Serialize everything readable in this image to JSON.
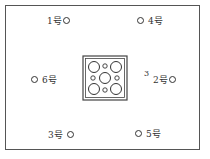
{
  "diagram": {
    "title": "",
    "stations": [
      {
        "id": "1",
        "label": "1号",
        "marker_side": "right"
      },
      {
        "id": "4",
        "label": "4号",
        "marker_side": "left"
      },
      {
        "id": "6",
        "label": "6号",
        "marker_side": "left"
      },
      {
        "id": "2",
        "label": "2号",
        "marker_side": "right"
      },
      {
        "id": "3",
        "label": "3号",
        "marker_side": "right"
      },
      {
        "id": "5",
        "label": "5号",
        "marker_side": "left"
      }
    ],
    "annotation": "3",
    "center_block": {
      "description": "square block with 5 large holes and 4 small holes",
      "large_holes": 5,
      "small_holes": 4
    }
  }
}
